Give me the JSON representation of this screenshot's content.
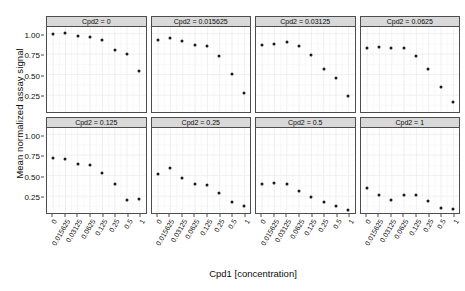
{
  "chart_data": {
    "type": "scatter",
    "title": "",
    "xlabel": "Cpd1 [concentration]",
    "ylabel": "Mean normalized assay signal",
    "grid": true,
    "legend": "none",
    "facet_variable": "Cpd2",
    "facet_layout": {
      "rows": 2,
      "cols": 4
    },
    "x_categorical": true,
    "categories": [
      "0",
      "0.015625",
      "0.03125",
      "0.0625",
      "0.125",
      "0.25",
      "0.5",
      "1"
    ],
    "ylim": [
      0.05,
      1.08
    ],
    "yticks": [
      "0.25",
      "0.50",
      "0.75",
      "1.00"
    ],
    "ytick_values": [
      0.25,
      0.5,
      0.75,
      1.0
    ],
    "panels": [
      {
        "strip": "Cpd2 = 0",
        "facet_value": "0",
        "values": [
          1.0,
          1.01,
          0.97,
          0.96,
          0.93,
          0.81,
          0.76,
          0.55
        ]
      },
      {
        "strip": "Cpd2 = 0.015625",
        "facet_value": "0.015625",
        "values": [
          0.93,
          0.95,
          0.92,
          0.86,
          0.85,
          0.73,
          0.51,
          0.28
        ]
      },
      {
        "strip": "Cpd2 = 0.03125",
        "facet_value": "0.03125",
        "values": [
          0.86,
          0.88,
          0.9,
          0.85,
          0.75,
          0.57,
          0.46,
          0.25
        ]
      },
      {
        "strip": "Cpd2 = 0.0625",
        "facet_value": "0.0625",
        "values": [
          0.83,
          0.84,
          0.83,
          0.83,
          0.73,
          0.57,
          0.36,
          0.17
        ]
      },
      {
        "strip": "Cpd2 = 0.125",
        "facet_value": "0.125",
        "values": [
          0.72,
          0.71,
          0.65,
          0.64,
          0.54,
          0.4,
          0.21,
          0.22
        ]
      },
      {
        "strip": "Cpd2 = 0.25",
        "facet_value": "0.25",
        "values": [
          0.53,
          0.6,
          0.48,
          0.4,
          0.39,
          0.29,
          0.19,
          0.14
        ]
      },
      {
        "strip": "Cpd2 = 0.5",
        "facet_value": "0.5",
        "values": [
          0.4,
          0.41,
          0.4,
          0.32,
          0.25,
          0.19,
          0.13,
          0.09
        ]
      },
      {
        "strip": "Cpd2 = 1",
        "facet_value": "1",
        "values": [
          0.36,
          0.27,
          0.21,
          0.27,
          0.27,
          0.2,
          0.11,
          0.1
        ]
      }
    ],
    "colors": {
      "point": "#1a1a1a",
      "panel_background": "#ffffff",
      "panel_border": "#4d4d4d",
      "strip_background": "#d9d9d9",
      "grid_major": "#ebebeb",
      "grid_minor": "#f4f4f4",
      "text": "#0d0d0d"
    }
  }
}
